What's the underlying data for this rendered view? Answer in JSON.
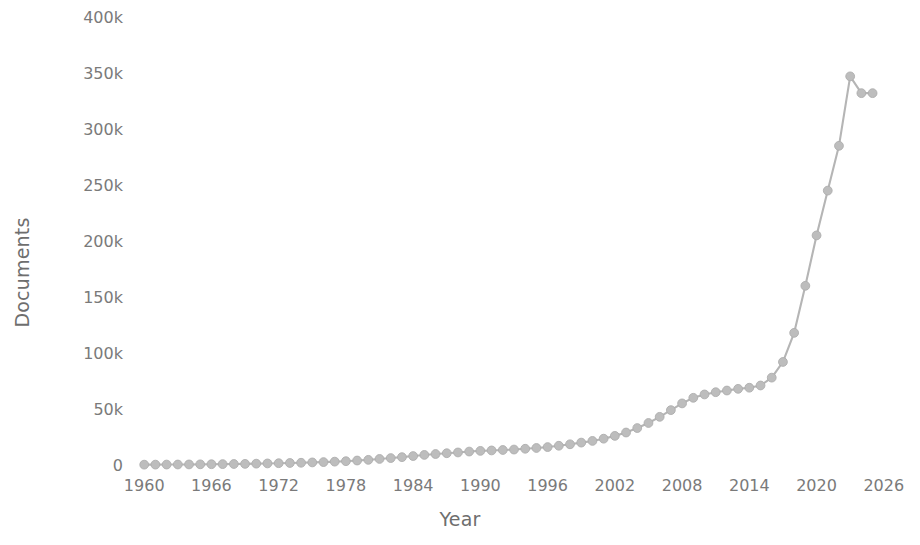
{
  "chart_data": {
    "type": "line",
    "title": "",
    "xlabel": "Year",
    "ylabel": "Documents",
    "xlim": [
      1959,
      2027
    ],
    "ylim": [
      0,
      400000
    ],
    "grid": false,
    "legend": null,
    "line_color": "#b5b5b5",
    "marker_color": "#bdbdbd",
    "background_color": "#ffffff",
    "x_tick_labels": [
      "1960",
      "1966",
      "1972",
      "1978",
      "1984",
      "1990",
      "1996",
      "2002",
      "2008",
      "2014",
      "2020",
      "2026"
    ],
    "x_tick_values": [
      1960,
      1966,
      1972,
      1978,
      1984,
      1990,
      1996,
      2002,
      2008,
      2014,
      2020,
      2026
    ],
    "y_tick_labels": [
      "0",
      "50k",
      "100k",
      "150k",
      "200k",
      "250k",
      "300k",
      "350k",
      "400k"
    ],
    "y_tick_values": [
      0,
      50000,
      100000,
      150000,
      200000,
      250000,
      300000,
      350000,
      400000
    ],
    "series": [
      {
        "name": "Documents",
        "x": [
          1960,
          1961,
          1962,
          1963,
          1964,
          1965,
          1966,
          1967,
          1968,
          1969,
          1970,
          1971,
          1972,
          1973,
          1974,
          1975,
          1976,
          1977,
          1978,
          1979,
          1980,
          1981,
          1982,
          1983,
          1984,
          1985,
          1986,
          1987,
          1988,
          1989,
          1990,
          1991,
          1992,
          1993,
          1994,
          1995,
          1996,
          1997,
          1998,
          1999,
          2000,
          2001,
          2002,
          2003,
          2004,
          2005,
          2006,
          2007,
          2008,
          2009,
          2010,
          2011,
          2012,
          2013,
          2014,
          2015,
          2016,
          2017,
          2018,
          2019,
          2020,
          2021,
          2022,
          2023,
          2024,
          2025
        ],
        "values": [
          300,
          350,
          400,
          450,
          500,
          600,
          700,
          800,
          900,
          1000,
          1200,
          1400,
          1600,
          1800,
          2000,
          2300,
          2600,
          3000,
          3400,
          4000,
          4600,
          5400,
          6200,
          7000,
          8000,
          9000,
          9800,
          10500,
          11200,
          12000,
          12600,
          13000,
          13400,
          13800,
          14500,
          15200,
          16000,
          17200,
          18500,
          20000,
          21500,
          23500,
          26000,
          29000,
          33000,
          37500,
          43000,
          49000,
          55000,
          60000,
          63000,
          65000,
          66500,
          68000,
          69000,
          71000,
          78000,
          92000,
          118000,
          160000,
          205000,
          245000,
          285000,
          347000,
          332000,
          332000
        ]
      }
    ]
  },
  "axes": {
    "y_title": "Documents",
    "x_title": "Year"
  }
}
